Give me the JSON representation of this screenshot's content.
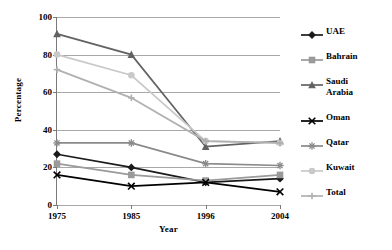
{
  "chart_data": {
    "type": "line",
    "title": "",
    "xlabel": "Year",
    "ylabel": "Percentage",
    "categories": [
      "1975",
      "1985",
      "1996",
      "2004"
    ],
    "x": [
      1975,
      1985,
      1996,
      2004
    ],
    "ylim": [
      0,
      100
    ],
    "yticks": [
      0,
      20,
      40,
      60,
      80,
      100
    ],
    "grid": true,
    "legend_position": "right",
    "series": [
      {
        "name": "UAE",
        "values": [
          27,
          20,
          12,
          14
        ],
        "color": "#1a1a1a",
        "marker": "diamond"
      },
      {
        "name": "Bahrain",
        "values": [
          22,
          16,
          13,
          16
        ],
        "color": "#9a9a9a",
        "marker": "square"
      },
      {
        "name": "Saudi Arabia",
        "values": [
          91,
          80,
          31,
          34
        ],
        "color": "#636363",
        "marker": "triangle"
      },
      {
        "name": "Oman",
        "values": [
          16,
          10,
          12,
          7
        ],
        "color": "#000000",
        "marker": "x"
      },
      {
        "name": "Qatar",
        "values": [
          33,
          33,
          22,
          21
        ],
        "color": "#8a8a8a",
        "marker": "asterisk"
      },
      {
        "name": "Kuwait",
        "values": [
          80,
          69,
          34,
          33
        ],
        "color": "#c9c9c9",
        "marker": "circle"
      },
      {
        "name": "Total",
        "values": [
          72,
          57,
          34,
          33
        ],
        "color": "#b0b0b0",
        "marker": "plus"
      }
    ]
  },
  "axes": {
    "y_title": "Percentage",
    "x_title": "Year",
    "y_tick_labels": [
      "0",
      "20",
      "40",
      "60",
      "80",
      "100"
    ],
    "x_tick_labels": [
      "1975",
      "1985",
      "1996",
      "2004"
    ]
  },
  "legend": {
    "items": [
      {
        "label": "UAE"
      },
      {
        "label": "Bahrain"
      },
      {
        "label": "Saudi\nArabia"
      },
      {
        "label": "Oman"
      },
      {
        "label": "Qatar"
      },
      {
        "label": "Kuwait"
      },
      {
        "label": "Total"
      }
    ]
  }
}
